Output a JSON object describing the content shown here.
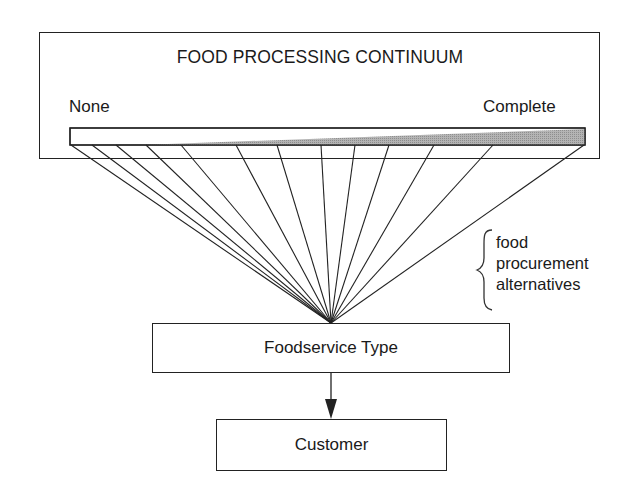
{
  "diagram": {
    "continuum_box": {
      "title": "FOOD PROCESSING CONTINUUM",
      "left_label": "None",
      "right_label": "Complete"
    },
    "bar": {
      "fill_color": "#a8a8a8",
      "border_color": "#222222"
    },
    "fan_lines": {
      "count": 13,
      "origins_x": [
        71,
        92,
        116,
        146,
        181,
        236,
        277,
        321,
        355,
        389,
        434,
        493,
        584
      ],
      "origin_y": 145,
      "convergence": [
        331,
        323
      ]
    },
    "brace_label": [
      "food",
      "procurement",
      "alternatives"
    ],
    "foodservice_box": {
      "label": "Foodservice Type"
    },
    "customer_box": {
      "label": "Customer"
    },
    "arrow": {
      "from": "Foodservice Type",
      "to": "Customer"
    }
  }
}
